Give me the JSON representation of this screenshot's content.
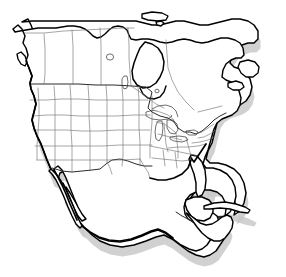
{
  "map": {
    "title": "North America",
    "projection": "conic",
    "background_color": "#ffffff",
    "coastline_color": "#000000",
    "internal_border_color": "#6e6e6e",
    "national_border_color": "#2a2a2a",
    "shadow_color": "#c9c9c9",
    "land_fill_color": "#ffffff",
    "has_labels": false,
    "has_legend": false,
    "has_graticule": false,
    "includes_alaska": false,
    "shadow_offset": "down-right",
    "regions": [
      {
        "name": "canada",
        "label": "Canada",
        "subdivisions_shown": true
      },
      {
        "name": "united-states",
        "label": "United States",
        "subdivisions_shown": true
      },
      {
        "name": "mexico",
        "label": "Mexico",
        "subdivisions_shown": false
      },
      {
        "name": "central-america",
        "label": "Central America",
        "subdivisions_shown": false
      },
      {
        "name": "cuba",
        "label": "Cuba",
        "subdivisions_shown": false
      }
    ],
    "features": [
      {
        "name": "hudson-bay",
        "label": "Hudson Bay"
      },
      {
        "name": "great-lakes",
        "label": "Great Lakes"
      },
      {
        "name": "baja-california",
        "label": "Baja California"
      },
      {
        "name": "gulf-of-california",
        "label": "Gulf of California"
      },
      {
        "name": "gulf-of-mexico",
        "label": "Gulf of Mexico"
      },
      {
        "name": "florida-peninsula",
        "label": "Florida"
      },
      {
        "name": "yucatan-peninsula",
        "label": "Yucatan"
      },
      {
        "name": "newfoundland",
        "label": "Newfoundland"
      },
      {
        "name": "vancouver-island",
        "label": "Vancouver Island"
      },
      {
        "name": "great-slave-lake",
        "label": "Great Slave Lake"
      },
      {
        "name": "lake-winnipeg",
        "label": "Lake Winnipeg"
      }
    ]
  }
}
